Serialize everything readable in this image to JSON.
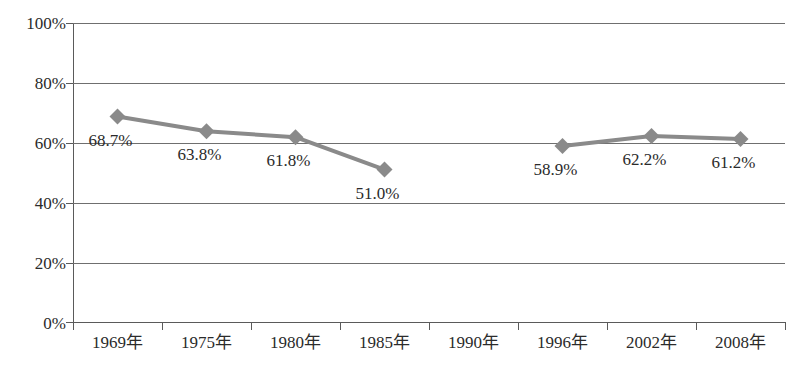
{
  "chart_data": {
    "type": "line",
    "title": "",
    "subtitle": "",
    "xlabel": "",
    "ylabel": "",
    "categories": [
      "1969年",
      "1975年",
      "1980年",
      "1985年",
      "1990年",
      "1996年",
      "2002年",
      "2008年"
    ],
    "series": [
      {
        "name": "",
        "values": [
          68.7,
          63.8,
          61.8,
          51.0,
          null,
          58.9,
          62.2,
          61.2
        ],
        "labels": [
          "68.7%",
          "63.8%",
          "61.8%",
          "51.0%",
          "",
          "58.9%",
          "62.2%",
          "61.2%"
        ],
        "color": "#8a8a8a",
        "marker": "diamond"
      }
    ],
    "ylim": [
      0,
      100
    ],
    "ytick_values": [
      0,
      20,
      40,
      60,
      80,
      100
    ],
    "ytick_labels": [
      "0%",
      "20%",
      "40%",
      "60%",
      "80%",
      "100%"
    ],
    "grid": true,
    "grid_axis": "y",
    "legend": false,
    "legend_position": "none",
    "colors": {
      "series_line": "#8a8a8a",
      "gridline": "#6f6f6f",
      "axis": "#5a5a5a",
      "text": "#2b2b2b",
      "background": "#ffffff"
    }
  }
}
